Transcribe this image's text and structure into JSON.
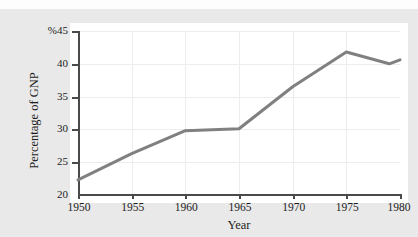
{
  "page": {
    "background_color": "#e9e9e9",
    "top_cut_text": "· · · · ·"
  },
  "chart_data": {
    "type": "line",
    "title": "",
    "xlabel": "Year",
    "ylabel": "Percentage of GNP",
    "x": [
      1950,
      1955,
      1960,
      1965,
      1970,
      1975,
      1979,
      1980
    ],
    "values": [
      22.3,
      26.3,
      29.8,
      30.1,
      36.5,
      41.8,
      40.0,
      40.6
    ],
    "xlim": [
      1950,
      1980
    ],
    "ylim": [
      20,
      45
    ],
    "xticks": [
      1950,
      1955,
      1960,
      1965,
      1970,
      1975,
      1980
    ],
    "xticklabels": [
      "1950",
      "1955",
      "1960",
      "1965",
      "1970",
      "1975",
      "1980"
    ],
    "yticks": [
      20,
      25,
      30,
      35,
      40,
      45
    ],
    "yticklabels": [
      "20",
      "25",
      "30",
      "35",
      "40",
      "%45"
    ],
    "grid": true,
    "legend": null,
    "line_color": "#808080",
    "line_width": 3,
    "plot_background": "#ffffff",
    "axis_color": "#4a4a4a",
    "grid_color": "#ededed"
  }
}
